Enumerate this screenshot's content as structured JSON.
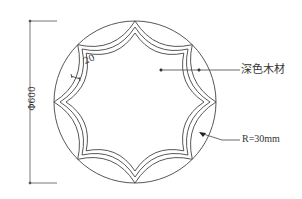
{
  "drawing": {
    "type": "technical-drawing",
    "stroke_color": "#444444",
    "background": "#ffffff",
    "outer_circle": {
      "cx": 135,
      "cy": 102,
      "r": 81
    },
    "star_points": 8,
    "labels": {
      "diameter": "Φ600",
      "material": "深色木材",
      "radius": "R=30mm",
      "thickness": "20"
    }
  }
}
